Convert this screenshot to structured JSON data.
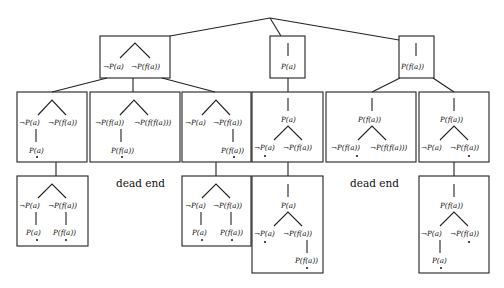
{
  "diagram": {
    "type": "tableau-search-tree",
    "labels": {
      "not_pa": "¬P(a)",
      "not_pfa": "¬P(f(a))",
      "not_pffa": "¬P(f(f(a)))",
      "pa": "P(a)",
      "pfa": "P(f(a))",
      "pffa": "P(f(f(a)))",
      "dead_end": "dead end"
    },
    "level1": [
      {
        "id": "box-a",
        "content": [
          "¬P(a)",
          "¬P(f(a))"
        ],
        "shape": "branching"
      },
      {
        "id": "box-b",
        "content": [
          "P(a)"
        ],
        "shape": "linear"
      },
      {
        "id": "box-c",
        "content": [
          "P(f(a))"
        ],
        "shape": "linear"
      }
    ],
    "level2": [
      {
        "parent": "box-a",
        "content": "¬P(a) ¬P(f(a)) / P(a)•"
      },
      {
        "parent": "box-a",
        "content": "¬P(f(a)) ¬P(f(f(a))) / P(f(a))•"
      },
      {
        "parent": "box-a",
        "content": "¬P(a) ¬P(f(a)) / P(f(a))•"
      },
      {
        "parent": "box-b",
        "content": "P(a) / ¬P(a)• ¬P(f(a))"
      },
      {
        "parent": "box-c",
        "content": "P(f(a)) / ¬P(f(a))• ¬P(f(f(a)))"
      },
      {
        "parent": "box-c",
        "content": "P(f(a)) / ¬P(a) ¬P(f(a))•"
      }
    ],
    "level3": [
      {
        "parent": 0,
        "content": "¬P(a) ¬P(f(a)) / P(a)• P(f(a))•"
      },
      {
        "parent": 1,
        "content": "dead end"
      },
      {
        "parent": 2,
        "content": "¬P(a) ¬P(f(a)) / P(a)• P(f(a))•"
      },
      {
        "parent": 3,
        "content": "P(a) / ¬P(a)• ¬P(f(a)) / P(f(a))•"
      },
      {
        "parent": 4,
        "content": "dead end"
      },
      {
        "parent": 5,
        "content": "P(f(a)) / ¬P(a) ¬P(f(a))• / P(a)•"
      }
    ]
  }
}
